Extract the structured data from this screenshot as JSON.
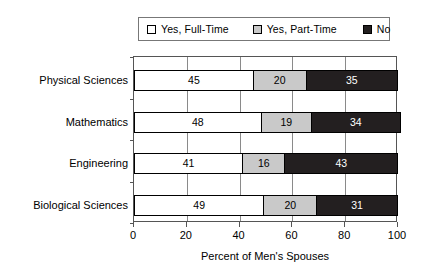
{
  "chart_data": {
    "type": "bar",
    "orientation": "horizontal",
    "stacked": true,
    "stacked_normalized": true,
    "title": "",
    "xlabel": "Percent of Men's Spouses",
    "ylabel": "",
    "xlim": [
      0,
      100
    ],
    "xticks": [
      0,
      20,
      40,
      60,
      80,
      100
    ],
    "xticklabels": [
      "0",
      "20",
      "40",
      "60",
      "80",
      "100"
    ],
    "grid": "vertical",
    "legend_position": "top",
    "categories": [
      "Physical Sciences",
      "Mathematics",
      "Engineering",
      "Biological Sciences"
    ],
    "series": [
      {
        "name": "Yes, Full-Time",
        "color": "#ffffff",
        "values": [
          45,
          48,
          41,
          49
        ]
      },
      {
        "name": "Yes, Part-Time",
        "color": "#c9c9c9",
        "values": [
          20,
          19,
          16,
          20
        ]
      },
      {
        "name": "No",
        "color": "#231f20",
        "values": [
          35,
          34,
          43,
          31
        ]
      }
    ]
  },
  "legend": {
    "entries": [
      {
        "label": "Yes, Full-Time",
        "swatch": "legend-swatch-full-time"
      },
      {
        "label": "Yes, Part-Time",
        "swatch": "legend-swatch-part-time"
      },
      {
        "label": "No",
        "swatch": "legend-swatch-no"
      }
    ]
  },
  "axis": {
    "x_title": "Percent of Men's Spouses",
    "x_tick_labels": [
      "0",
      "20",
      "40",
      "60",
      "80",
      "100"
    ],
    "y_tick_labels": [
      "Physical Sciences",
      "Mathematics",
      "Engineering",
      "Biological Sciences"
    ]
  },
  "bar_labels": {
    "physical_sciences": [
      "45",
      "20",
      "35"
    ],
    "mathematics": [
      "48",
      "19",
      "34"
    ],
    "engineering": [
      "41",
      "16",
      "43"
    ],
    "biological_sciences": [
      "49",
      "20",
      "31"
    ]
  },
  "colors": {
    "full_time": "#ffffff",
    "part_time": "#c9c9c9",
    "no": "#231f20",
    "axis": "#555555",
    "grid": "#8a8a8a",
    "text": "#000000"
  }
}
